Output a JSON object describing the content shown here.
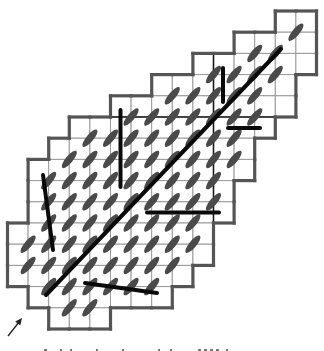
{
  "diagram": {
    "grid": {
      "x0": 7.5,
      "y0": 11,
      "col_pitch": 20.6,
      "row_pitch": 21.2,
      "rows": [
        {
          "row": 0,
          "cols": [
            13,
            14
          ]
        },
        {
          "row": 1,
          "cols": [
            11,
            14
          ]
        },
        {
          "row": 2,
          "cols": [
            9,
            14
          ]
        },
        {
          "row": 3,
          "cols": [
            7,
            13
          ]
        },
        {
          "row": 4,
          "cols": [
            5,
            13
          ]
        },
        {
          "row": 5,
          "cols": [
            3,
            12
          ]
        },
        {
          "row": 6,
          "cols": [
            2,
            11
          ]
        },
        {
          "row": 7,
          "cols": [
            1,
            11
          ]
        },
        {
          "row": 8,
          "cols": [
            1,
            10
          ]
        },
        {
          "row": 9,
          "cols": [
            1,
            10
          ]
        },
        {
          "row": 10,
          "cols": [
            0,
            9
          ]
        },
        {
          "row": 11,
          "cols": [
            0,
            9
          ]
        },
        {
          "row": 12,
          "cols": [
            0,
            8
          ]
        },
        {
          "row": 13,
          "cols": [
            1,
            7
          ]
        },
        {
          "row": 14,
          "cols": [
            2,
            4
          ]
        }
      ],
      "cell_line_color": "#9a9a9a",
      "border_color": "#555555",
      "inner_dark_lines": [
        {
          "x1": 110,
          "y1": 117,
          "x2": 275,
          "y2": 117
        },
        {
          "x1": 213.5,
          "y1": 53,
          "x2": 213.5,
          "y2": 223
        }
      ]
    },
    "ellipses": {
      "color": "#4a4a4a",
      "rx": 11,
      "ry": 3.6,
      "angle": -50,
      "rows": [
        {
          "k": 1,
          "j": [
            14
          ]
        },
        {
          "k": 2,
          "j": [
            12,
            13
          ]
        },
        {
          "k": 3,
          "j": [
            10,
            11,
            12,
            13
          ]
        },
        {
          "k": 4,
          "j": [
            8,
            9,
            10,
            11,
            12
          ]
        },
        {
          "k": 5,
          "j": [
            6,
            7,
            8,
            9,
            10,
            11,
            12
          ]
        },
        {
          "k": 6,
          "j": [
            4,
            5,
            6,
            7,
            8,
            9,
            10,
            11
          ]
        },
        {
          "k": 7,
          "j": [
            3,
            4,
            5,
            6,
            7,
            8,
            9,
            10,
            11
          ]
        },
        {
          "k": 8,
          "j": [
            2,
            3,
            4,
            5,
            6,
            7,
            8,
            9,
            10
          ]
        },
        {
          "k": 9,
          "j": [
            2,
            3,
            4,
            5,
            6,
            7,
            8,
            9,
            10
          ]
        },
        {
          "k": 10,
          "j": [
            2,
            3,
            4,
            5,
            6,
            7,
            8,
            9
          ]
        },
        {
          "k": 11,
          "j": [
            1,
            2,
            3,
            4,
            5,
            6,
            7,
            8,
            9
          ]
        },
        {
          "k": 12,
          "j": [
            1,
            2,
            3,
            4,
            5,
            6,
            7,
            8
          ]
        },
        {
          "k": 13,
          "j": [
            2,
            3,
            4,
            5,
            6,
            7
          ]
        },
        {
          "k": 14,
          "j": [
            3,
            4
          ]
        }
      ]
    },
    "thick_lines": {
      "color": "#0a0a0a",
      "width": 4,
      "segments": [
        {
          "name": "long-diagonal",
          "x1": 46,
          "y1": 295,
          "x2": 281,
          "y2": 49
        },
        {
          "name": "vertical-left",
          "x1": 120.5,
          "y1": 110,
          "x2": 120.5,
          "y2": 187
        },
        {
          "name": "vertical-short-right",
          "x1": 223,
          "y1": 68,
          "x2": 223,
          "y2": 102
        },
        {
          "name": "horizontal-short-right",
          "x1": 228,
          "y1": 128,
          "x2": 260,
          "y2": 128
        },
        {
          "name": "horizontal-middle",
          "x1": 147,
          "y1": 212.5,
          "x2": 219,
          "y2": 212.5
        },
        {
          "name": "slanted-left",
          "x1": 43,
          "y1": 175,
          "x2": 53,
          "y2": 250
        },
        {
          "name": "slanted-bottom",
          "x1": 85,
          "y1": 283,
          "x2": 157,
          "y2": 293
        }
      ]
    },
    "arrow": {
      "x1": 8,
      "y1": 336,
      "x2": 22,
      "y2": 318,
      "color": "#222222"
    },
    "caption_clipped": true
  }
}
